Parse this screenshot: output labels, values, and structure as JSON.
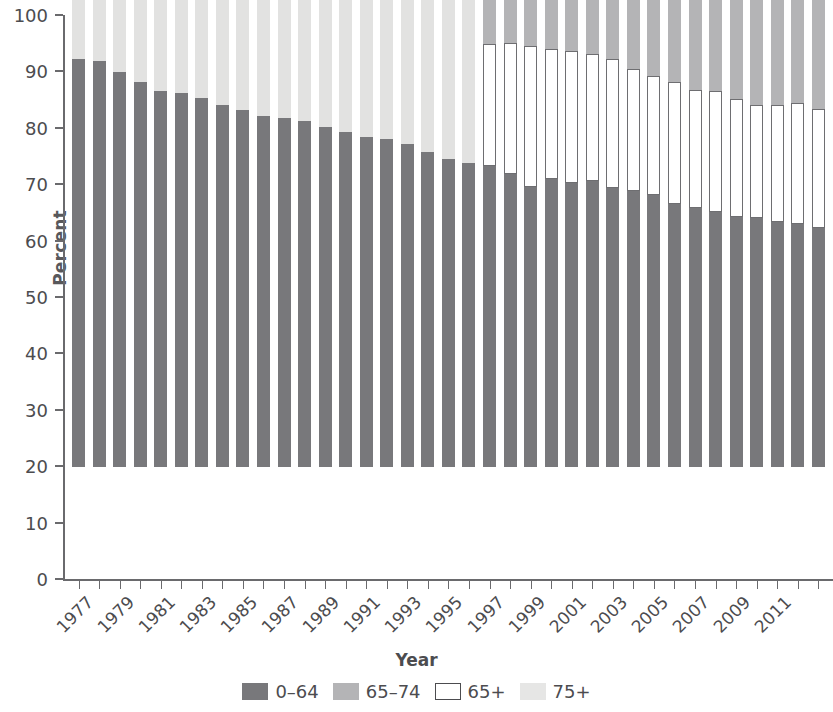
{
  "chart_data": {
    "type": "bar",
    "stacked": true,
    "title": "",
    "xlabel": "Year",
    "ylabel": "Percent",
    "ylim": [
      0,
      100
    ],
    "yticks": [
      0,
      10,
      20,
      30,
      40,
      50,
      60,
      70,
      80,
      90,
      100
    ],
    "ytick_labels": [
      "0",
      "10",
      "20",
      "30",
      "40",
      "50",
      "60",
      "70",
      "80",
      "90",
      "100"
    ],
    "grid": false,
    "legend_position": "bottom",
    "legend": [
      {
        "label": "0–64",
        "color": "#78787b",
        "style": "filled"
      },
      {
        "label": "65–74",
        "color": "#b4b4b6",
        "style": "filled"
      },
      {
        "label": "65+",
        "color": "#ffffff",
        "style": "outlined"
      },
      {
        "label": "75+",
        "color": "#e6e6e5",
        "style": "filled"
      }
    ],
    "x": [
      "1977",
      "1978",
      "1979",
      "1980",
      "1981",
      "1982",
      "1983",
      "1984",
      "1985",
      "1986",
      "1987",
      "1988",
      "1989",
      "1990",
      "1991",
      "1992",
      "1993",
      "1994",
      "1995",
      "1996",
      "1997",
      "1998",
      "1999",
      "2000",
      "2001",
      "2002",
      "2003",
      "2004",
      "2005",
      "2006",
      "2007",
      "2008",
      "2009",
      "2010",
      "2011",
      "2012",
      "2013"
    ],
    "xtick_labels_shown": [
      "1977",
      "1979",
      "1981",
      "1983",
      "1985",
      "1987",
      "1989",
      "1991",
      "1993",
      "1995",
      "1997",
      "1999",
      "2001",
      "2003",
      "2005",
      "2007",
      "2009",
      "2011"
    ],
    "series": [
      {
        "name": "0–64",
        "color": "#78787b",
        "values": [
          72.3,
          72.0,
          70.0,
          68.2,
          66.7,
          66.3,
          65.4,
          64.2,
          63.3,
          62.2,
          61.9,
          61.3,
          60.2,
          59.4,
          58.5,
          58.2,
          57.2,
          55.9,
          54.6,
          53.9,
          53.3,
          52.0,
          49.7,
          51.0,
          50.3,
          50.7,
          49.4,
          48.9,
          48.2,
          46.7,
          46.0,
          45.2,
          44.3,
          44.2,
          43.5,
          43.0,
          42.4
        ]
      },
      {
        "name": "65+",
        "color": "#ffffff",
        "style": "outlined",
        "note": "present only from 1997 onward; stacked above 0–64",
        "values": [
          null,
          null,
          null,
          null,
          null,
          null,
          null,
          null,
          null,
          null,
          null,
          null,
          null,
          null,
          null,
          null,
          null,
          null,
          null,
          null,
          21.7,
          23.1,
          24.9,
          23.2,
          23.5,
          22.5,
          23.0,
          21.6,
          21.1,
          21.5,
          20.9,
          21.4,
          20.9,
          20.0,
          20.7,
          21.5,
          21.0
        ]
      },
      {
        "name": "65–74",
        "color": "#b4b4b6",
        "note": "top band from 1997 onward",
        "values": [
          null,
          null,
          null,
          null,
          null,
          null,
          null,
          null,
          null,
          null,
          null,
          null,
          null,
          null,
          null,
          null,
          null,
          null,
          null,
          null,
          25.0,
          24.9,
          25.4,
          25.8,
          26.2,
          26.8,
          27.6,
          29.5,
          30.7,
          31.8,
          33.1,
          33.4,
          34.8,
          35.8,
          35.8,
          35.5,
          36.6
        ]
      },
      {
        "name": "75+",
        "color": "#e2e2e1",
        "note": "top band for 1977–1996",
        "values": [
          27.7,
          28.0,
          30.0,
          31.8,
          33.3,
          33.7,
          34.6,
          35.8,
          36.7,
          37.8,
          38.1,
          38.7,
          39.8,
          40.6,
          41.5,
          41.8,
          42.8,
          44.1,
          45.4,
          46.1,
          null,
          null,
          null,
          null,
          null,
          null,
          null,
          null,
          null,
          null,
          null,
          null,
          null,
          null,
          null,
          null,
          null
        ]
      }
    ]
  },
  "axes": {
    "y_title": "Percent",
    "x_title": "Year"
  }
}
